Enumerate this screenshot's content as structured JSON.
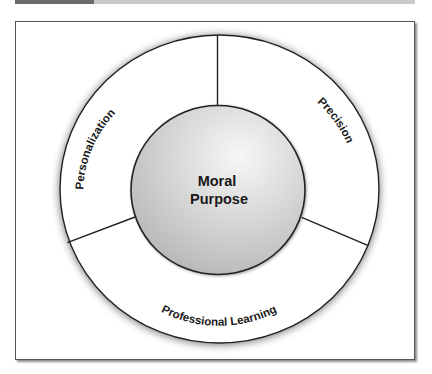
{
  "header_bar": {
    "dark_color": "#6b6b6b",
    "light_color": "#c9c9c9"
  },
  "diagram": {
    "center": {
      "line1": "Moral",
      "line2": "Purpose"
    },
    "segments": [
      {
        "id": "personalization",
        "label": "Personalization"
      },
      {
        "id": "precision",
        "label": "Precision"
      },
      {
        "id": "professional-learning",
        "label": "Professional Learning"
      }
    ],
    "colors": {
      "stroke": "#222222",
      "inner_fill_light": "#f4f4f4",
      "inner_fill_dark": "#b9b9b9",
      "ring_fill": "#ffffff",
      "text": "#1a1a1a"
    }
  }
}
